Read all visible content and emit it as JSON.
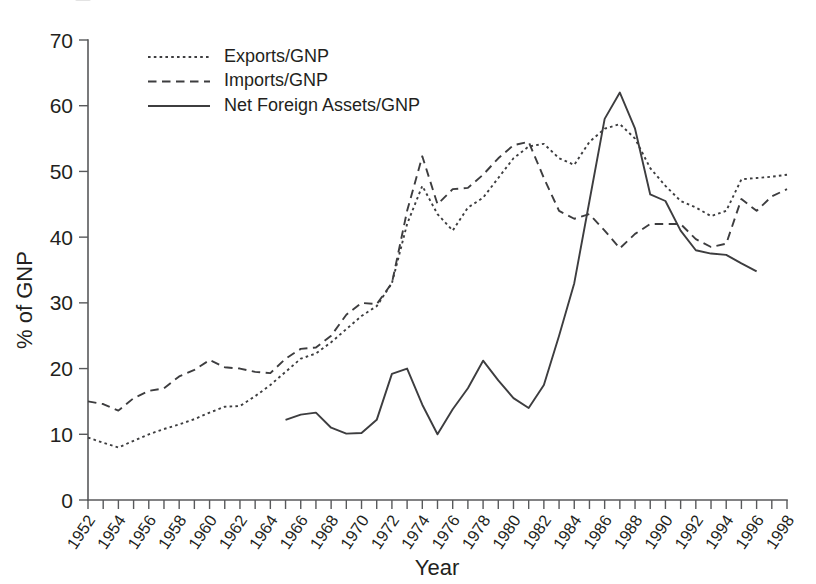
{
  "figure": {
    "background": "#ffffff",
    "line_color": "#3d3d3f",
    "axis_color": "#58595b",
    "text_color": "#231f20"
  },
  "axes": {
    "y_title": "% of GNP",
    "x_title": "Year",
    "y_ticks": [
      "0",
      "10",
      "20",
      "30",
      "40",
      "50",
      "60",
      "70"
    ],
    "x_ticks": [
      "1952",
      "1954",
      "1956",
      "1958",
      "1960",
      "1962",
      "1964",
      "1966",
      "1968",
      "1970",
      "1972",
      "1974",
      "1976",
      "1978",
      "1980",
      "1982",
      "1984",
      "1986",
      "1988",
      "1990",
      "1992",
      "1994",
      "1996",
      "1998"
    ]
  },
  "legend": {
    "position": "top-left-inside",
    "entries": [
      {
        "label": "Exports/GNP",
        "style": "dotted"
      },
      {
        "label": "Imports/GNP",
        "style": "dashed"
      },
      {
        "label": "Net Foreign Assets/GNP",
        "style": "solid"
      }
    ]
  },
  "chart_data": {
    "type": "line",
    "title": "",
    "xlabel": "Year",
    "ylabel": "% of GNP",
    "xlim": [
      1952,
      1998
    ],
    "ylim": [
      0,
      70
    ],
    "ytick_step": 10,
    "xtick_step_minor": 1,
    "xtick_step_major": 2,
    "grid": false,
    "legend_position": "top-left-inside",
    "series": [
      {
        "name": "Exports/GNP",
        "style": "dotted",
        "x": [
          1952,
          1953,
          1954,
          1955,
          1956,
          1957,
          1958,
          1959,
          1960,
          1961,
          1962,
          1963,
          1964,
          1965,
          1966,
          1967,
          1968,
          1969,
          1970,
          1971,
          1972,
          1973,
          1974,
          1975,
          1976,
          1977,
          1978,
          1979,
          1980,
          1981,
          1982,
          1983,
          1984,
          1985,
          1986,
          1987,
          1988,
          1989,
          1990,
          1991,
          1992,
          1993,
          1994,
          1995,
          1996,
          1997,
          1998
        ],
        "values": [
          9.5,
          8.7,
          8.0,
          9.0,
          10.0,
          10.8,
          11.5,
          12.3,
          13.3,
          14.2,
          14.3,
          15.8,
          17.5,
          19.5,
          21.5,
          22.3,
          24.0,
          26.0,
          28.0,
          29.5,
          33.0,
          42.0,
          47.8,
          43.5,
          41.0,
          44.5,
          46.0,
          49.0,
          52.0,
          53.8,
          54.2,
          52.0,
          51.0,
          54.5,
          56.5,
          57.2,
          55.0,
          50.5,
          47.8,
          45.5,
          44.5,
          43.2,
          44.0,
          48.8,
          49.0,
          49.2,
          49.5
        ]
      },
      {
        "name": "Imports/GNP",
        "style": "dashed",
        "x": [
          1952,
          1953,
          1954,
          1955,
          1956,
          1957,
          1958,
          1959,
          1960,
          1961,
          1962,
          1963,
          1964,
          1965,
          1966,
          1967,
          1968,
          1969,
          1970,
          1971,
          1972,
          1973,
          1974,
          1975,
          1976,
          1977,
          1978,
          1979,
          1980,
          1981,
          1982,
          1983,
          1984,
          1985,
          1986,
          1987,
          1988,
          1989,
          1990,
          1991,
          1992,
          1993,
          1994,
          1995,
          1996,
          1997,
          1998
        ],
        "values": [
          15.0,
          14.6,
          13.6,
          15.5,
          16.6,
          17.0,
          18.8,
          19.8,
          21.3,
          20.2,
          20.0,
          19.5,
          19.3,
          21.5,
          23.0,
          23.2,
          25.0,
          28.2,
          30.0,
          29.8,
          33.0,
          44.0,
          52.3,
          45.0,
          47.3,
          47.5,
          49.5,
          52.0,
          54.0,
          54.5,
          49.0,
          44.0,
          42.8,
          43.5,
          41.0,
          38.3,
          40.5,
          42.0,
          42.0,
          42.0,
          39.7,
          38.5,
          39.0,
          45.8,
          44.0,
          46.2,
          47.3
        ]
      },
      {
        "name": "Net Foreign Assets/GNP",
        "style": "solid",
        "x": [
          1965,
          1966,
          1967,
          1968,
          1969,
          1970,
          1971,
          1972,
          1973,
          1974,
          1975,
          1976,
          1977,
          1978,
          1979,
          1980,
          1981,
          1982,
          1983,
          1984,
          1985,
          1986,
          1987,
          1988,
          1989,
          1990,
          1991,
          1992,
          1993,
          1994,
          1995,
          1996
        ],
        "values": [
          12.2,
          13.0,
          13.3,
          11.0,
          10.1,
          10.2,
          12.2,
          19.2,
          20.0,
          14.5,
          10.0,
          13.8,
          17.0,
          21.2,
          18.2,
          15.5,
          14.0,
          17.5,
          25.0,
          33.0,
          45.5,
          58.0,
          62.0,
          56.5,
          46.5,
          45.5,
          41.0,
          38.0,
          37.5,
          37.3,
          36.0,
          34.8
        ]
      }
    ]
  }
}
